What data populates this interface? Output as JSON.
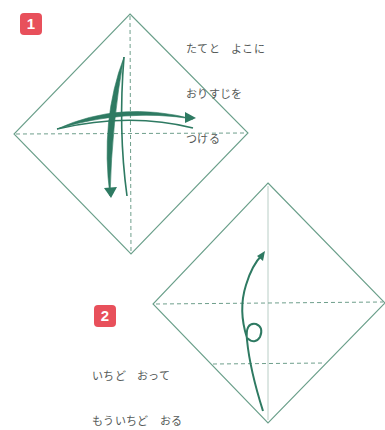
{
  "colors": {
    "paper_outline": "#5b9a83",
    "fold_line": "#6f9f8c",
    "arrow": "#2e7a62",
    "badge_bg": "#e8505b",
    "badge_text": "#ffffff",
    "text": "#555a58"
  },
  "steps": [
    {
      "number": "1",
      "instruction_lines": [
        "たてと　よこに",
        "おりすじを",
        "つける"
      ]
    },
    {
      "number": "2",
      "instruction_lines": [
        "いちど　おって",
        "もういちど　おる"
      ]
    }
  ]
}
